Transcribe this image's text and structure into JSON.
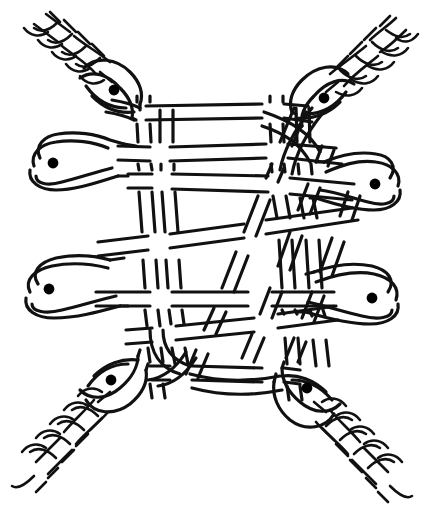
{
  "artwork": {
    "title": "Interlaced Serpent Knotwork",
    "style": "celtic-insular-line-drawing",
    "medium": "pen-and-ink line art",
    "canvas": {
      "width": 428,
      "height": 529
    },
    "colors": {
      "background": "#ffffff",
      "ink": "#111111",
      "eye": "#000000"
    },
    "stroke": {
      "band_outline_width": 3.2,
      "braid_width": 2.6,
      "band_gap": 13
    },
    "motif_counts": {
      "serpents": 8,
      "eyes": 8,
      "braided_tails": 4,
      "horizontal_bands": 4,
      "vertical_bands": 4,
      "diagonal_bands": 3
    }
  },
  "serpents": [
    {
      "id": "serpent-top-left",
      "head_x": 114,
      "head_y": 90,
      "eye_x": 114,
      "eye_y": 90,
      "orientation": "diagonal-up-left",
      "has_braided_tail": true
    },
    {
      "id": "serpent-top-right",
      "head_x": 324,
      "head_y": 98,
      "eye_x": 324,
      "eye_y": 98,
      "orientation": "diagonal-up-right",
      "has_braided_tail": true
    },
    {
      "id": "serpent-mid-left-upper",
      "head_x": 53,
      "head_y": 163,
      "eye_x": 53,
      "eye_y": 163,
      "orientation": "horizontal-left",
      "has_braided_tail": false
    },
    {
      "id": "serpent-mid-right-upper",
      "head_x": 375,
      "head_y": 184,
      "eye_x": 375,
      "eye_y": 184,
      "orientation": "horizontal-right",
      "has_braided_tail": false
    },
    {
      "id": "serpent-mid-left-lower",
      "head_x": 49,
      "head_y": 289,
      "eye_x": 49,
      "eye_y": 289,
      "orientation": "horizontal-left",
      "has_braided_tail": false
    },
    {
      "id": "serpent-mid-right-lower",
      "head_x": 372,
      "head_y": 298,
      "eye_x": 372,
      "eye_y": 298,
      "orientation": "horizontal-right",
      "has_braided_tail": false
    },
    {
      "id": "serpent-bottom-left",
      "head_x": 111,
      "head_y": 380,
      "eye_x": 111,
      "eye_y": 380,
      "orientation": "diagonal-down-left",
      "has_braided_tail": true
    },
    {
      "id": "serpent-bottom-right",
      "head_x": 307,
      "head_y": 388,
      "eye_x": 307,
      "eye_y": 388,
      "orientation": "diagonal-down-right",
      "has_braided_tail": true
    }
  ],
  "bands": {
    "horizontal": [
      {
        "id": "h1",
        "y": 108,
        "x_start": 140,
        "x_end": 300
      },
      {
        "id": "h2",
        "y": 148,
        "x_start": 108,
        "x_end": 330
      },
      {
        "id": "h3",
        "y": 178,
        "x_start": 132,
        "x_end": 352
      },
      {
        "id": "h4",
        "y": 238,
        "x_start": 90,
        "x_end": 352
      },
      {
        "id": "h5",
        "y": 288,
        "x_start": 90,
        "x_end": 330
      },
      {
        "id": "h6",
        "y": 328,
        "x_start": 120,
        "x_end": 340
      },
      {
        "id": "h7",
        "y": 368,
        "x_start": 150,
        "x_end": 300
      }
    ],
    "vertical": [
      {
        "id": "v1",
        "x_top": 139,
        "x_bottom": 156
      },
      {
        "id": "v2",
        "x_top": 160,
        "x_bottom": 178
      },
      {
        "id": "v3",
        "x_top": 275,
        "x_bottom": 290
      },
      {
        "id": "v4",
        "x_top": 300,
        "x_bottom": 315
      }
    ],
    "diagonal": [
      {
        "id": "d1",
        "x_top": 300,
        "x_bottom": 160
      },
      {
        "id": "d2",
        "x_top": 328,
        "x_bottom": 196
      },
      {
        "id": "d3",
        "x_top": 352,
        "x_bottom": 230
      }
    ]
  },
  "braids": [
    {
      "id": "braid-top-left",
      "from_x": 96,
      "from_y": 72,
      "to_x": 22,
      "to_y": 18,
      "strands": 3
    },
    {
      "id": "braid-top-right",
      "from_x": 346,
      "from_y": 84,
      "to_x": 412,
      "to_y": 22,
      "strands": 3
    },
    {
      "id": "braid-bottom-left",
      "from_x": 92,
      "from_y": 402,
      "to_x": 26,
      "to_y": 508,
      "strands": 3
    },
    {
      "id": "braid-bottom-right",
      "from_x": 330,
      "from_y": 412,
      "to_x": 400,
      "to_y": 512,
      "strands": 3
    }
  ]
}
